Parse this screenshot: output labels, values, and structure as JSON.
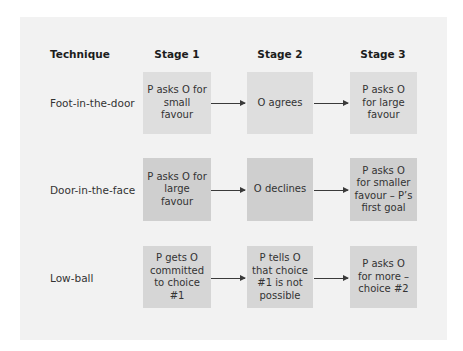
{
  "headers": {
    "technique": "Technique",
    "stage1": "Stage 1",
    "stage2": "Stage 2",
    "stage3": "Stage 3"
  },
  "rows": [
    {
      "technique": "Foot-in-the-door",
      "stage1": "P asks O for small favour",
      "stage2": "O agrees",
      "stage3": "P asks O for large favour"
    },
    {
      "technique": "Door-in-the-face",
      "stage1": "P asks O for large favour",
      "stage2": "O declines",
      "stage3": "P asks O for smaller favour – P’s first goal"
    },
    {
      "technique": "Low-ball",
      "stage1": "P gets O committed to choice #1",
      "stage2": "P tells O that choice #1 is not possible",
      "stage3": "P asks O for more – choice #2"
    }
  ],
  "colors": {
    "page_background": "#ffffff",
    "panel_background": "#f2f2f2",
    "row1_box": "#dedede",
    "row2_box": "#cfcfcf",
    "row3_box": "#d6d6d6",
    "arrow": "#3a3a3a"
  }
}
